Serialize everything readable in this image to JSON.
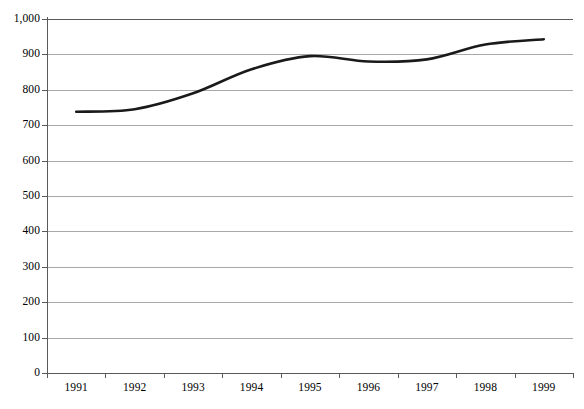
{
  "chart_data": {
    "type": "line",
    "title": "",
    "subtitle": "",
    "xlabel": "",
    "ylabel": "",
    "categories": [
      "1991",
      "1992",
      "1993",
      "1994",
      "1995",
      "1996",
      "1997",
      "1998",
      "1999"
    ],
    "series": [
      {
        "name": "",
        "values": [
          738,
          745,
          790,
          858,
          895,
          880,
          886,
          928,
          943
        ],
        "color": "#1a1a1a",
        "line_width": 2.6,
        "smooth": true,
        "markers": false
      }
    ],
    "ylim": [
      0,
      1000
    ],
    "ytick_values": [
      0,
      100,
      200,
      300,
      400,
      500,
      600,
      700,
      800,
      900,
      1000
    ],
    "ytick_labels": [
      "0",
      "100",
      "200",
      "300",
      "400",
      "500",
      "600",
      "700",
      "800",
      "900",
      "1,000"
    ],
    "xtick_labels": [
      "1991",
      "1992",
      "1993",
      "1994",
      "1995",
      "1996",
      "1997",
      "1998",
      "1999"
    ],
    "grid": {
      "horizontal": true,
      "vertical": false,
      "color": "#a8a8a8"
    },
    "legend": {
      "visible": false,
      "position": "none",
      "entries": []
    },
    "axis": {
      "color": "#5a5a5a",
      "x_labels_between_ticks": true
    },
    "annotations": [],
    "background": "#ffffff"
  }
}
